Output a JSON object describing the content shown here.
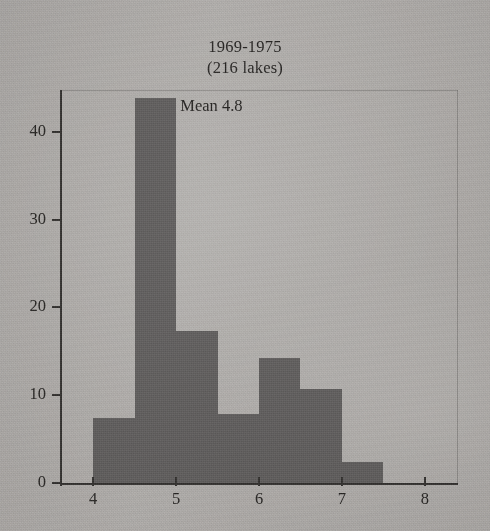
{
  "chart_data": {
    "type": "bar",
    "title": "1969-1975",
    "subtitle": "(216 lakes)",
    "xlabel": "",
    "ylabel": "",
    "xlim": [
      3.6,
      8.4
    ],
    "ylim": [
      0,
      45
    ],
    "grid": false,
    "legend": "none",
    "bin_width": 0.5,
    "bin_edges": [
      4.0,
      4.5,
      5.0,
      5.5,
      6.0,
      6.5,
      7.0,
      7.5
    ],
    "bin_starts": [
      4.0,
      4.5,
      5.0,
      5.5,
      6.0,
      6.5,
      7.0
    ],
    "values": [
      7.5,
      44,
      17.4,
      8,
      14.4,
      10.8,
      2.5
    ],
    "xticks": [
      4,
      5,
      6,
      7,
      8
    ],
    "xtick_labels": [
      "4",
      "5",
      "6",
      "7",
      "8"
    ],
    "yticks": [
      0,
      10,
      20,
      30,
      40
    ],
    "ytick_labels": [
      "0",
      "10",
      "20",
      "30",
      "40"
    ],
    "annotations": [
      {
        "text": "Mean 4.8",
        "x": 5.05,
        "y": 42
      }
    ],
    "colors": {
      "bar_fill": "#6e6c6c",
      "axis": "#3a3836",
      "text": "#2b2927",
      "background": "#cdcbc9",
      "frame": "#787674"
    }
  }
}
